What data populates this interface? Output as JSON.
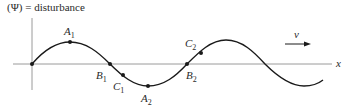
{
  "diagram": {
    "y_axis_label": "(Ψ) = disturbance",
    "x_axis_label": "x",
    "velocity_label": "v",
    "points": [
      {
        "name": "A",
        "sub": "1",
        "x": 70,
        "y": 42,
        "lx": 64,
        "ly": 35
      },
      {
        "name": "B",
        "sub": "1",
        "x": 110,
        "y": 64,
        "lx": 96,
        "ly": 79
      },
      {
        "name": "C",
        "sub": "1",
        "x": 123,
        "y": 75,
        "lx": 113,
        "ly": 90
      },
      {
        "name": "A",
        "sub": "2",
        "x": 148,
        "y": 86,
        "lx": 141,
        "ly": 102
      },
      {
        "name": "B",
        "sub": "2",
        "x": 187,
        "y": 64,
        "lx": 186,
        "ly": 79
      },
      {
        "name": "C",
        "sub": "2",
        "x": 201,
        "y": 53,
        "lx": 185,
        "ly": 47
      }
    ],
    "colors": {
      "curve": "#1a1a1a",
      "axis": "#9a9a9a",
      "text": "#2a2a2a"
    }
  }
}
